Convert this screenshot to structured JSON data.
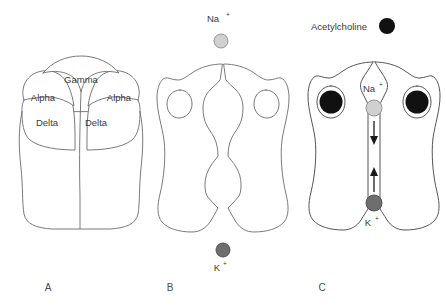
{
  "figure": {
    "background_color": "#ffffff",
    "outline_color": "#6b6b6b"
  },
  "panels": [
    {
      "id": "A",
      "label": "A",
      "caption_label": "A",
      "description": "Nicotinic acetylcholine receptor viewed showing five subunits",
      "subunits": [
        {
          "name": "Gamma",
          "label": "Gamma",
          "position": "top-center"
        },
        {
          "name": "Alpha-left",
          "label": "Alpha",
          "position": "upper-left"
        },
        {
          "name": "Alpha-right",
          "label": "Alpha",
          "position": "upper-right"
        },
        {
          "name": "Delta-left",
          "label": "Delta",
          "position": "lower-left"
        },
        {
          "name": "Delta-right",
          "label": "Delta",
          "position": "lower-right"
        }
      ]
    },
    {
      "id": "B",
      "label": "B",
      "caption_label": "B",
      "description": "Closed channel with constricted pore",
      "ions": [
        {
          "name": "sodium",
          "label": "Na",
          "charge": "+",
          "color": "#d0d0d0",
          "stroke": "#8a8a8a",
          "position": "above-channel"
        },
        {
          "name": "potassium",
          "label": "K",
          "charge": "+",
          "color": "#6e6e6e",
          "stroke": "#4a4a4a",
          "position": "below-channel"
        }
      ]
    },
    {
      "id": "C",
      "label": "C",
      "caption_label": "C",
      "description": "Open channel with acetylcholine bound; ions flow through pore",
      "legend": {
        "label": "Acetylcholine",
        "marker_color": "#111111"
      },
      "bound_ligands": [
        {
          "name": "acetylcholine-left",
          "color": "#111111"
        },
        {
          "name": "acetylcholine-right",
          "color": "#111111"
        }
      ],
      "ions": [
        {
          "name": "sodium",
          "label": "Na",
          "charge": "+",
          "color": "#d0d0d0",
          "stroke": "#8a8a8a",
          "flow": "inward-downward"
        },
        {
          "name": "potassium",
          "label": "K",
          "charge": "+",
          "color": "#6e6e6e",
          "stroke": "#4a4a4a",
          "flow": "outward-upward"
        }
      ]
    }
  ]
}
